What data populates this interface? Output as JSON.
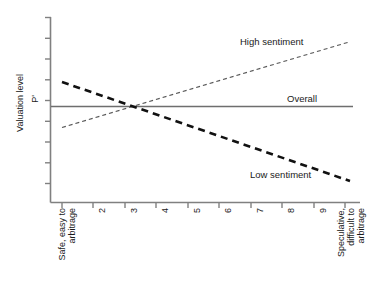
{
  "chart_data": {
    "type": "line",
    "title": "",
    "xlabel": "",
    "ylabel": "Valuation level",
    "y_reference_label": "P'",
    "grid": false,
    "legend_position": "inline-annotations",
    "x_tick_labels": [
      "Safe, easy to arbitrage",
      "2",
      "3",
      "4",
      "5",
      "6",
      "7",
      "8",
      "9",
      "Speculative, difficult to arbitrage"
    ],
    "x": [
      1,
      2,
      3,
      4,
      5,
      6,
      7,
      8,
      9,
      10
    ],
    "xlim": [
      1,
      10
    ],
    "ylim": [
      0,
      10
    ],
    "y_axis_ticks_shown": true,
    "y_tick_labels": [],
    "series": [
      {
        "name": "High sentiment",
        "style": "thin-dashed",
        "color": "#555555",
        "values": [
          3.1,
          3.72,
          4.35,
          4.97,
          5.6,
          6.22,
          6.85,
          7.47,
          8.1,
          8.72
        ]
      },
      {
        "name": "Overall",
        "style": "solid",
        "color": "#6e6e6e",
        "values": [
          5.3,
          5.3,
          5.3,
          5.3,
          5.3,
          5.3,
          5.3,
          5.3,
          5.3,
          5.3
        ]
      },
      {
        "name": "Low sentiment",
        "style": "thick-dashed",
        "color": "#111111",
        "values": [
          6.6,
          6.15,
          5.7,
          5.25,
          4.8,
          4.35,
          3.9,
          3.45,
          3.0,
          2.55
        ]
      }
    ],
    "annotations": [
      {
        "text": "High sentiment",
        "series": "High sentiment"
      },
      {
        "text": "Overall",
        "series": "Overall"
      },
      {
        "text": "Low sentiment",
        "series": "Low sentiment"
      }
    ],
    "intersection_x": 3.3,
    "axis_color": "#808080"
  }
}
